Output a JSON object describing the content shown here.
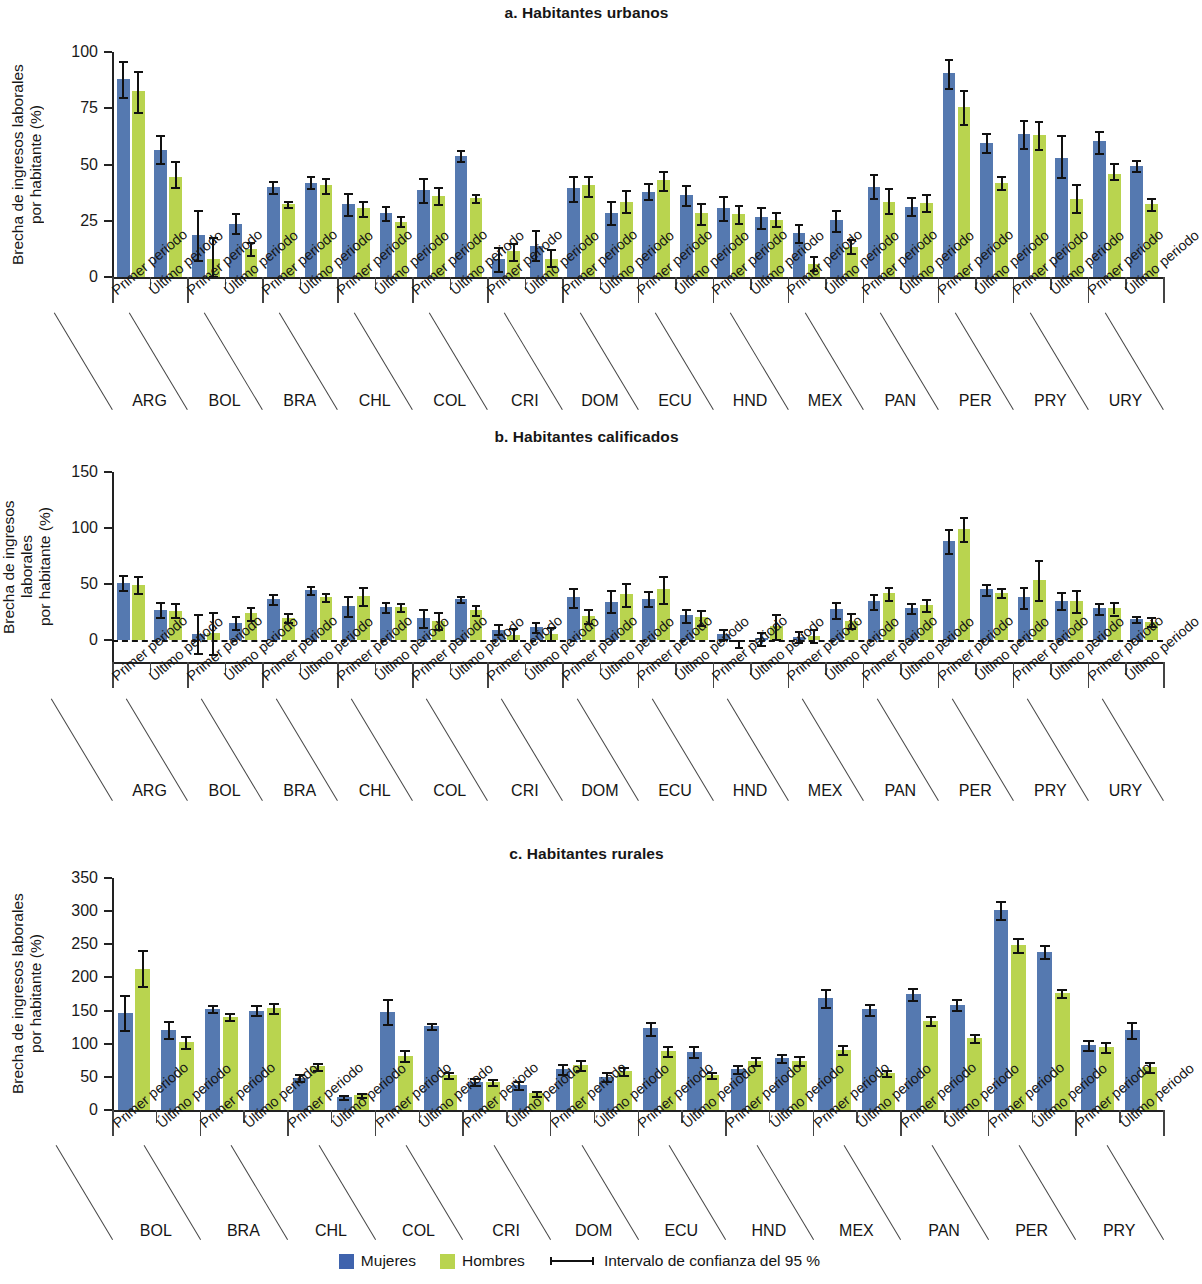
{
  "figure": {
    "ylabel": "Brecha de ingresos laborales\npor habitante (%)",
    "period_first": "Primer periodo",
    "period_last": "Último periodo"
  },
  "legend": {
    "women": "Mujeres",
    "men": "Hombres",
    "ci": "Intervalo de confianza del 95 %",
    "color_women": "#3f63ad",
    "color_men": "#b9d44f"
  },
  "chart_data": [
    {
      "type": "bar",
      "id": "a",
      "title": "a. Habitantes urbanos",
      "ylabel": "Brecha de ingresos laborales por habitante (%)",
      "xlabel": "",
      "ylim": [
        0,
        100
      ],
      "yticks": [
        0,
        25,
        50,
        75,
        100
      ],
      "grid": false,
      "legend_position": "bottom",
      "categories": [
        "ARG",
        "BOL",
        "BRA",
        "CHL",
        "COL",
        "CRI",
        "DOM",
        "ECU",
        "HND",
        "MEX",
        "PAN",
        "PER",
        "PRY",
        "URY"
      ],
      "subcategories": [
        "Primer periodo",
        "Último periodo"
      ],
      "series": [
        {
          "name": "Mujeres",
          "values": [
            88,
            56.5,
            18.5,
            23.5,
            40,
            42,
            32.5,
            28.5,
            38.5,
            54,
            8,
            14,
            39.5,
            28.5,
            38,
            36.5,
            30.5,
            26.5,
            19.5,
            25.5,
            40,
            31,
            90.5,
            59.5,
            63.5,
            53,
            60.5,
            49.5
          ],
          "ci_low": [
            80,
            50.5,
            7.5,
            19.5,
            37.5,
            39.5,
            27.5,
            25.5,
            33.5,
            51.5,
            2.5,
            7.5,
            34,
            23.5,
            34.5,
            32,
            25.5,
            22,
            15.5,
            20.5,
            35,
            27.5,
            84,
            55.5,
            57.5,
            44.5,
            55,
            47
          ],
          "ci_high": [
            96,
            63,
            30,
            28.5,
            42.5,
            45,
            37.5,
            31.5,
            44,
            56.5,
            13.5,
            21,
            45,
            34,
            42,
            41,
            36,
            31,
            23.5,
            30,
            46,
            35.5,
            97,
            64,
            70,
            63,
            65,
            52
          ]
        },
        {
          "name": "Hombres",
          "values": [
            82.5,
            44.5,
            8,
            12.5,
            32.5,
            41,
            30.5,
            24.5,
            36,
            35,
            11.5,
            8,
            41,
            33.5,
            43,
            28.5,
            28,
            25.5,
            6,
            13.5,
            33.5,
            33,
            75.5,
            42,
            63,
            34.5,
            46,
            32.5
          ],
          "ci_low": [
            73.5,
            40,
            0.5,
            10,
            31,
            37.5,
            27,
            22.5,
            32.5,
            33.5,
            7.5,
            5,
            36,
            29,
            38.5,
            23.5,
            24,
            22.5,
            3,
            10.5,
            28.5,
            29.5,
            68,
            39,
            57,
            29,
            43.5,
            30
          ],
          "ci_high": [
            91.5,
            51.5,
            18,
            15.5,
            34,
            44,
            34,
            27,
            40,
            37,
            15,
            12.5,
            45,
            38.5,
            47,
            33,
            32,
            29,
            9.5,
            17,
            39.5,
            37,
            83,
            45,
            69.5,
            41.5,
            50.5,
            35
          ]
        }
      ]
    },
    {
      "type": "bar",
      "id": "b",
      "title": "b. Habitantes calificados",
      "ylabel": "Brecha de ingresos laborales por habitante (%)",
      "xlabel": "",
      "ylim": [
        -20,
        150
      ],
      "yticks": [
        0,
        50,
        100,
        150
      ],
      "grid": false,
      "zero_line": true,
      "legend_position": "bottom",
      "categories": [
        "ARG",
        "BOL",
        "BRA",
        "CHL",
        "COL",
        "CRI",
        "DOM",
        "ECU",
        "HND",
        "MEX",
        "PAN",
        "PER",
        "PRY",
        "URY"
      ],
      "subcategories": [
        "Primer periodo",
        "Último periodo"
      ],
      "series": [
        {
          "name": "Mujeres",
          "values": [
            51,
            26.5,
            5.5,
            15,
            36,
            44.5,
            30,
            29.5,
            19.5,
            36,
            9,
            11,
            38,
            34,
            36,
            22,
            5,
            1.5,
            2.5,
            27,
            34.5,
            28,
            88,
            45.5,
            38,
            34.5,
            28,
            18.5
          ],
          "ci_low": [
            44.5,
            20,
            -12,
            9.5,
            31.5,
            41,
            21,
            25,
            11,
            33.5,
            5,
            7,
            29,
            24.5,
            30,
            16,
            0.5,
            -4.5,
            -2.5,
            19.5,
            27,
            23.5,
            77.5,
            40,
            28,
            27,
            23,
            15.5
          ],
          "ci_high": [
            58,
            33.5,
            23,
            21,
            40.5,
            48,
            39,
            33.5,
            27.5,
            39,
            14,
            16,
            46.5,
            44.5,
            43.5,
            27.5,
            9.5,
            7,
            7.5,
            33.5,
            41,
            33,
            99,
            49.5,
            47.5,
            42.5,
            32.5,
            21.5
          ]
        },
        {
          "name": "Hombres",
          "values": [
            49,
            26,
            6,
            23.5,
            19.5,
            38.5,
            39,
            29,
            17,
            26.5,
            4.5,
            5.5,
            21,
            40.5,
            45.5,
            20,
            -2.5,
            12,
            3.5,
            17,
            41.5,
            31,
            99,
            42,
            53.5,
            34.5,
            28,
            16
          ],
          "ci_low": [
            41.5,
            20,
            -13,
            18,
            15.5,
            35,
            31,
            25.5,
            9.5,
            22,
            0,
            0,
            14.5,
            30,
            33,
            13.5,
            -6.5,
            1,
            -2.5,
            10,
            35.5,
            26,
            88,
            38,
            35.5,
            25,
            22.5,
            12.5
          ],
          "ci_high": [
            57,
            32.5,
            24.5,
            29,
            24,
            42,
            47.5,
            33,
            25,
            31,
            10,
            11,
            27.5,
            50.5,
            57,
            26.5,
            0,
            23,
            9.5,
            24,
            47.5,
            36,
            110,
            46.5,
            71,
            44,
            33.5,
            20
          ]
        }
      ]
    },
    {
      "type": "bar",
      "id": "c",
      "title": "c. Habitantes rurales",
      "ylabel": "Brecha de ingresos laborales por habitante (%)",
      "xlabel": "",
      "ylim": [
        0,
        350
      ],
      "yticks": [
        0,
        50,
        100,
        150,
        200,
        250,
        300,
        350
      ],
      "grid": false,
      "legend_position": "bottom",
      "categories": [
        "BOL",
        "BRA",
        "CHL",
        "COL",
        "CRI",
        "DOM",
        "ECU",
        "HND",
        "MEX",
        "PAN",
        "PER",
        "PRY"
      ],
      "subcategories": [
        "Primer periodo",
        "Último periodo"
      ],
      "series": [
        {
          "name": "Mujeres",
          "values": [
            147,
            121,
            153,
            150,
            48,
            19,
            148,
            127,
            42,
            37,
            62,
            50,
            123,
            88,
            62,
            78,
            169,
            152,
            175,
            159,
            301,
            239,
            98,
            120
          ],
          "ci_low": [
            121,
            108,
            148,
            143,
            43,
            16,
            130,
            122,
            37,
            31,
            55,
            44,
            113,
            80,
            56,
            72,
            156,
            144,
            166,
            151,
            288,
            230,
            91,
            108
          ],
          "ci_high": [
            173,
            135,
            159,
            158,
            54,
            23,
            168,
            132,
            48,
            44,
            69,
            57,
            133,
            96,
            68,
            85,
            182,
            160,
            184,
            168,
            315,
            249,
            105,
            133
          ]
        },
        {
          "name": "Hombres",
          "values": [
            212,
            102,
            141,
            154,
            66,
            22,
            82,
            53,
            42,
            25,
            68,
            59,
            89,
            53,
            74,
            74,
            91,
            56,
            135,
            108,
            249,
            177,
            95,
            65
          ],
          "ci_low": [
            187,
            93,
            136,
            147,
            61,
            19,
            74,
            49,
            37,
            21,
            61,
            53,
            81,
            48,
            68,
            68,
            84,
            52,
            128,
            102,
            239,
            171,
            87,
            58
          ],
          "ci_high": [
            241,
            111,
            147,
            162,
            71,
            26,
            91,
            57,
            47,
            29,
            75,
            65,
            97,
            58,
            80,
            81,
            98,
            61,
            142,
            114,
            259,
            183,
            103,
            72
          ]
        }
      ]
    }
  ]
}
